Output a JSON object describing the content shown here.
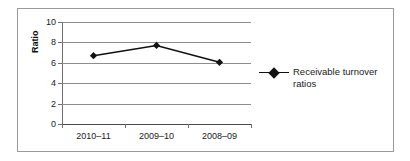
{
  "chart_data": {
    "type": "line",
    "title": "",
    "xlabel": "",
    "ylabel": "Ratio",
    "categories": [
      "2010–11",
      "2009–10",
      "2008–09"
    ],
    "series": [
      {
        "name": "Receivable turnover ratios",
        "values": [
          6.7,
          7.7,
          6.05
        ]
      }
    ],
    "ylim": [
      0,
      10
    ],
    "y_ticks": [
      0,
      2,
      4,
      6,
      8,
      10
    ],
    "y_tick_labels": [
      "0",
      "2",
      "4",
      "6",
      "8",
      "10"
    ],
    "grid": true,
    "legend_position": "right",
    "marker": "diamond",
    "colors": {
      "series_line": "#111111",
      "marker": "#111111",
      "gridline": "#8d8d8d",
      "axis": "#6e6e6e",
      "frame_border": "#9a9a9a",
      "background": "#ffffff",
      "text": "#1a1a1a"
    }
  },
  "legend": {
    "entries": [
      {
        "label": "Receivable turnover ratios",
        "marker": "diamond-marker"
      }
    ]
  },
  "axis": {
    "y_title": "Ratio"
  }
}
